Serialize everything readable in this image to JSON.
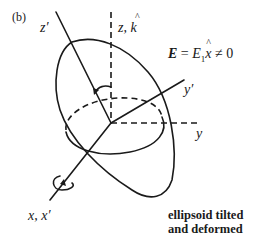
{
  "panel_label": "(b)",
  "axes": {
    "z_prime": "z′",
    "z_k": "z, k",
    "z_k_hat": "^",
    "y_prime": "y′",
    "y": "y",
    "x_xprime": "x, x′"
  },
  "equation": {
    "lhs": "E",
    "eq": " = ",
    "e1": "E",
    "sub1": "1",
    "xhat": "x",
    "hat": "^",
    "rhs": " ≠ 0"
  },
  "caption": {
    "line1": "ellipsoid tilted",
    "line2": "and deformed"
  },
  "colors": {
    "stroke": "#1a1a1a",
    "background": "#ffffff"
  }
}
